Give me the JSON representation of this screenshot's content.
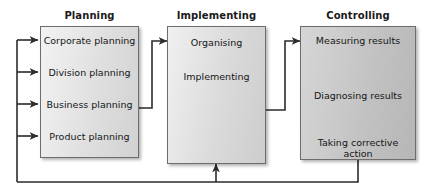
{
  "diagram": {
    "type": "management-process-flow",
    "background_color": "#ffffff",
    "line_color": "#333333",
    "border_color": "#6d6d6d",
    "text_color": "#151515",
    "stages": [
      {
        "id": "planning",
        "title": "Planning",
        "box_fill_light": "#f2f2f2",
        "box_fill_dark": "#d2d2d2",
        "steps": [
          {
            "label": "Corporate planning"
          },
          {
            "label": "Division planning"
          },
          {
            "label": "Business planning"
          },
          {
            "label": "Product planning"
          }
        ]
      },
      {
        "id": "implementing",
        "title": "Implementing",
        "box_fill_light": "#f0f0f0",
        "box_fill_dark": "#cdcdcd",
        "steps": [
          {
            "label": "Organising"
          },
          {
            "label": "Implementing"
          }
        ]
      },
      {
        "id": "controlling",
        "title": "Controlling",
        "box_fill_light": "#d6d6d6",
        "box_fill_dark": "#b6b6b6",
        "steps": [
          {
            "label": "Measuring results"
          },
          {
            "label": "Diagnosing results"
          },
          {
            "label": "Taking corrective\naction"
          }
        ]
      }
    ],
    "connectors": [
      {
        "id": "planning-to-implementing",
        "from": "Business planning",
        "to": "Organising"
      },
      {
        "id": "implementing-to-controlling",
        "from": "Implementing stage",
        "to": "Measuring results"
      },
      {
        "id": "feedback-to-implementing",
        "from": "Taking corrective action",
        "to": "Implementing stage"
      },
      {
        "id": "feedback-to-planning-bus",
        "from": "Taking corrective action",
        "to": "Planning steps"
      }
    ],
    "feedback_bus_targets": [
      "Corporate planning",
      "Division planning",
      "Business planning",
      "Product planning"
    ]
  }
}
